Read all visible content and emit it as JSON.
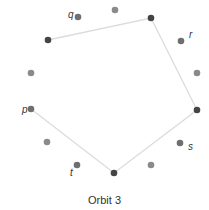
{
  "caption": "Orbit 3",
  "colors": {
    "dark": "#444444",
    "mid": "#6f6f6f",
    "light": "#8a8a8a",
    "edge": "#dcdcdc",
    "label": "#333333"
  },
  "nodes": [
    {
      "id": "n0",
      "x": 115,
      "y": 10,
      "tone": "light",
      "label": ""
    },
    {
      "id": "n1",
      "x": 151,
      "y": 18,
      "tone": "dark",
      "label": ""
    },
    {
      "id": "n2",
      "x": 181,
      "y": 41,
      "tone": "mid",
      "label": "r",
      "lx": 189,
      "ly": 38
    },
    {
      "id": "n3",
      "x": 197,
      "y": 73,
      "tone": "light",
      "label": ""
    },
    {
      "id": "n4",
      "x": 197,
      "y": 110,
      "tone": "dark",
      "label": ""
    },
    {
      "id": "n5",
      "x": 180,
      "y": 143,
      "tone": "mid",
      "label": "s",
      "lx": 188,
      "ly": 150
    },
    {
      "id": "n6",
      "x": 151,
      "y": 165,
      "tone": "light",
      "label": ""
    },
    {
      "id": "n7",
      "x": 114,
      "y": 173,
      "tone": "dark",
      "label": ""
    },
    {
      "id": "n8",
      "x": 77,
      "y": 165,
      "tone": "mid",
      "label": "t",
      "lx": 70,
      "ly": 176
    },
    {
      "id": "n9",
      "x": 47,
      "y": 142,
      "tone": "light",
      "label": ""
    },
    {
      "id": "n10",
      "x": 31,
      "y": 109,
      "tone": "mid",
      "label": "p",
      "lx": 22,
      "ly": 113
    },
    {
      "id": "n11",
      "x": 31,
      "y": 73,
      "tone": "light",
      "label": ""
    },
    {
      "id": "n12",
      "x": 48,
      "y": 40,
      "tone": "dark",
      "label": ""
    },
    {
      "id": "n13",
      "x": 78,
      "y": 17,
      "tone": "mid",
      "label": "q",
      "lx": 68,
      "ly": 18
    }
  ],
  "path": [
    "n12",
    "n1",
    "n4",
    "n7",
    "n10"
  ]
}
